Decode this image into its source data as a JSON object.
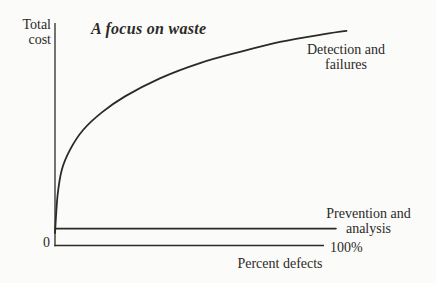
{
  "colors": {
    "ink": "#2b2a27",
    "paper": "#fbfbf9"
  },
  "figure": {
    "title": "A focus on waste",
    "y_axis_label": "Total\ncost",
    "x_axis_label": "Percent defects",
    "origin_label": "0",
    "x_max_label": "100%"
  },
  "chart_data": {
    "type": "line",
    "title": "A focus on waste",
    "xlabel": "Percent defects",
    "ylabel": "Total cost",
    "x_axis_range_percent": [
      0,
      100
    ],
    "y_axis_range_relative_cost": [
      0,
      1
    ],
    "grid": false,
    "legend_position": "labels-beside-lines",
    "series": [
      {
        "name": "Detection and\nfailures",
        "x": [
          0,
          1,
          2.6,
          5.7,
          10.6,
          17.7,
          26.4,
          39.6,
          54.7,
          69.8,
          84.9,
          100,
          110
        ],
        "y": [
          0.056,
          0.227,
          0.342,
          0.431,
          0.519,
          0.598,
          0.67,
          0.751,
          0.82,
          0.87,
          0.915,
          0.947,
          0.965
        ]
      },
      {
        "name": "Prevention and\nanalysis",
        "x": [
          0,
          106
        ],
        "y": [
          0.076,
          0.076
        ]
      }
    ]
  }
}
